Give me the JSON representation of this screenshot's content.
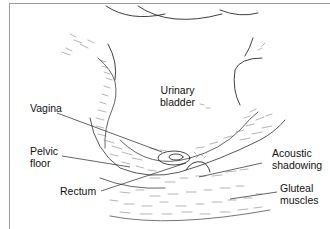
{
  "figure": {
    "type": "anatomical ultrasound diagram",
    "labels": {
      "urinary_bladder": "Urinary\nbladder",
      "vagina": "Vagina",
      "pelvic_floor": "Pelvic\nfloor",
      "rectum": "Rectum",
      "acoustic_shadowing": "Acoustic\nshadowing",
      "gluteal_muscles": "Gluteal\nmuscles"
    },
    "colors": {
      "line": "#2a2a2a",
      "hatch": "#6a6a6a",
      "frame": "#9a9a9a",
      "background": "#ffffff"
    }
  }
}
